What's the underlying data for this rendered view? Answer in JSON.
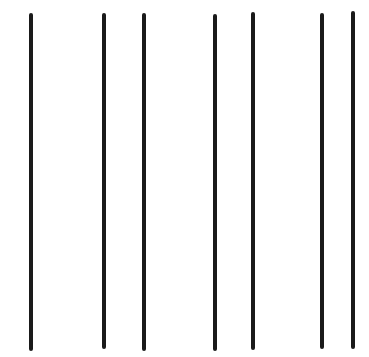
{
  "figure": {
    "background": "#ffffff",
    "stroke_color": "#1a1a1a",
    "stroke_width": 4,
    "lines": [
      {
        "x": 31,
        "y1": 15,
        "y2": 349
      },
      {
        "x": 104,
        "y1": 15,
        "y2": 347
      },
      {
        "x": 144,
        "y1": 15,
        "y2": 349
      },
      {
        "x": 215,
        "y1": 16,
        "y2": 349
      },
      {
        "x": 253,
        "y1": 14,
        "y2": 348
      },
      {
        "x": 322,
        "y1": 15,
        "y2": 347
      },
      {
        "x": 353,
        "y1": 13,
        "y2": 347
      }
    ]
  }
}
